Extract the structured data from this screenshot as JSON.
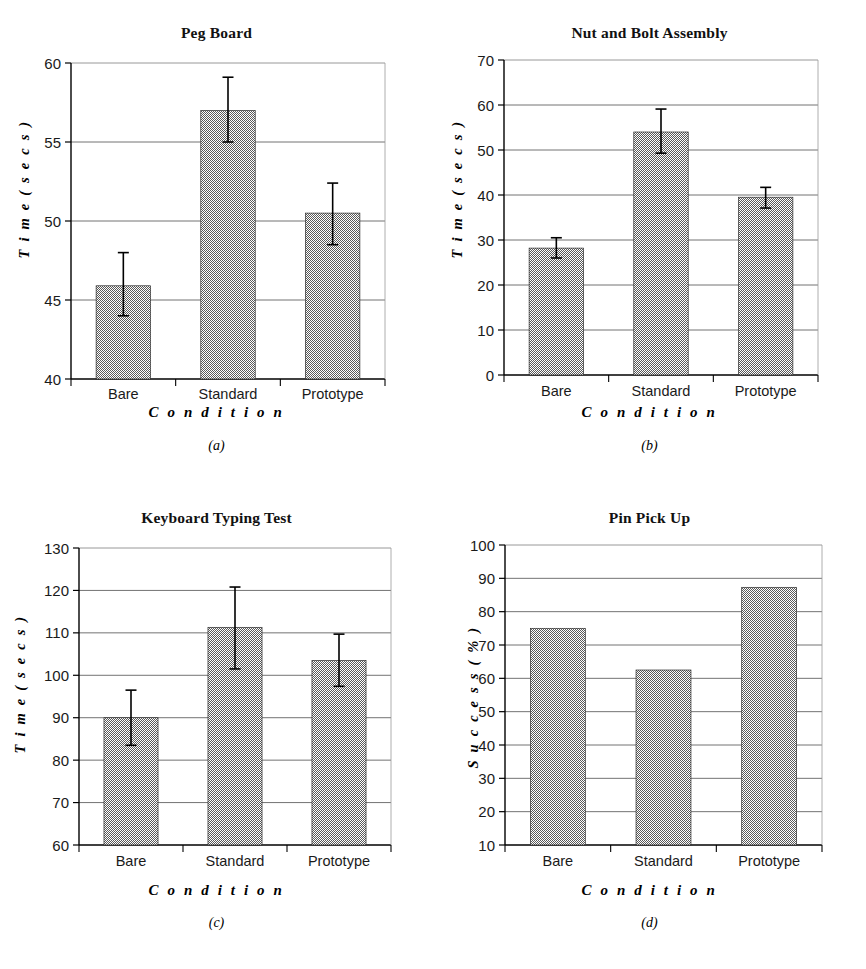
{
  "figure": {
    "background": "#ffffff",
    "bar_fill": "#8a8a8a",
    "axis_color": "#000000",
    "grid_color": "#555555",
    "panel_count": 4
  },
  "panels": [
    {
      "key": "a",
      "caption": "(a)",
      "chart_data": {
        "type": "bar",
        "title": "Peg Board",
        "xlabel": "C o n d i t i o n",
        "ylabel": "T i m e  ( s e c s )",
        "categories": [
          "Bare",
          "Standard",
          "Prototype"
        ],
        "values": [
          45.9,
          57.0,
          50.5
        ],
        "error_low": [
          44.0,
          55.0,
          48.5
        ],
        "error_high": [
          48.0,
          59.1,
          52.4
        ],
        "ylim": [
          40,
          60
        ],
        "yticks": [
          40,
          45,
          50,
          55,
          60
        ],
        "grid": true,
        "legend": "none",
        "has_error_bars": true
      }
    },
    {
      "key": "b",
      "caption": "(b)",
      "chart_data": {
        "type": "bar",
        "title": "Nut and Bolt Assembly",
        "xlabel": "C o n d i t i o n",
        "ylabel": "T i m e  ( s e c s )",
        "categories": [
          "Bare",
          "Standard",
          "Prototype"
        ],
        "values": [
          28.2,
          54.0,
          39.5
        ],
        "error_low": [
          26.0,
          49.3,
          37.1
        ],
        "error_high": [
          30.5,
          59.1,
          41.7
        ],
        "ylim": [
          0,
          70
        ],
        "yticks": [
          0,
          10,
          20,
          30,
          40,
          50,
          60,
          70
        ],
        "grid": true,
        "legend": "none",
        "has_error_bars": true
      }
    },
    {
      "key": "c",
      "caption": "(c)",
      "chart_data": {
        "type": "bar",
        "title": "Keyboard Typing Test",
        "xlabel": "C o n d i t i o n",
        "ylabel": "T i m e  ( s e c s )",
        "categories": [
          "Bare",
          "Standard",
          "Prototype"
        ],
        "values": [
          90.0,
          111.3,
          103.5
        ],
        "error_low": [
          83.5,
          101.5,
          97.4
        ],
        "error_high": [
          96.5,
          120.8,
          109.7
        ],
        "ylim": [
          60,
          130
        ],
        "yticks": [
          60,
          70,
          80,
          90,
          100,
          110,
          120,
          130
        ],
        "grid": true,
        "legend": "none",
        "has_error_bars": true
      }
    },
    {
      "key": "d",
      "caption": "(d)",
      "chart_data": {
        "type": "bar",
        "title": "Pin Pick Up",
        "xlabel": "C o n d i t i o n",
        "ylabel": "S u c c e s s  ( % )",
        "categories": [
          "Bare",
          "Standard",
          "Prototype"
        ],
        "values": [
          75.0,
          62.5,
          87.3
        ],
        "error_low": null,
        "error_high": null,
        "ylim": [
          10,
          100
        ],
        "yticks": [
          10,
          20,
          30,
          40,
          50,
          60,
          70,
          80,
          90,
          100
        ],
        "grid": true,
        "legend": "none",
        "has_error_bars": false
      }
    }
  ]
}
